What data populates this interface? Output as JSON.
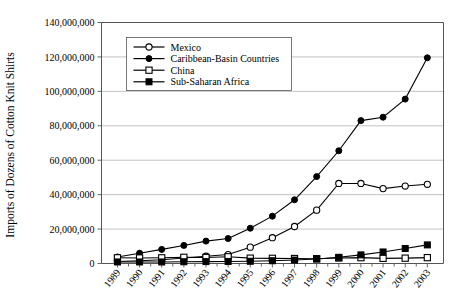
{
  "chart_data": {
    "type": "line",
    "title": "",
    "xlabel": "",
    "ylabel": "Imports of Dozens of Cotton Knit Shirts",
    "categories": [
      "1989",
      "1990",
      "1991",
      "1992",
      "1993",
      "1994",
      "1995",
      "1996",
      "1997",
      "1998",
      "1999",
      "2000",
      "2001",
      "2002",
      "2003"
    ],
    "x": [
      1989,
      1990,
      1991,
      1992,
      1993,
      1994,
      1995,
      1996,
      1997,
      1998,
      1999,
      2000,
      2001,
      2002,
      2003
    ],
    "ylim": [
      0,
      140000000
    ],
    "ytick_values": [
      0,
      20000000,
      40000000,
      60000000,
      80000000,
      100000000,
      120000000,
      140000000
    ],
    "ytick_labels": [
      "0",
      "20,000,000",
      "40,000,000",
      "60,000,000",
      "80,000,000",
      "100,000,000",
      "120,000,000",
      "140,000,000"
    ],
    "grid": "horizontal",
    "legend_position": "upper-left-inside",
    "series": [
      {
        "name": "Mexico",
        "marker": "open-circle",
        "values": [
          1200000,
          1600000,
          2200000,
          3200000,
          4200000,
          5200000,
          9500000,
          15000000,
          21500000,
          31000000,
          46500000,
          46500000,
          43500000,
          45000000,
          46000000
        ]
      },
      {
        "name": "Caribbean-Basin Countries",
        "marker": "filled-circle",
        "values": [
          3800000,
          6000000,
          8200000,
          10500000,
          13000000,
          14500000,
          20500000,
          27500000,
          37000000,
          50500000,
          65500000,
          83000000,
          85000000,
          95500000,
          119500000
        ]
      },
      {
        "name": "China",
        "marker": "open-square",
        "values": [
          3300000,
          3200000,
          3300000,
          3600000,
          3500000,
          3900000,
          3100000,
          3000000,
          2900000,
          2800000,
          3200000,
          3400000,
          3000000,
          3100000,
          3400000
        ]
      },
      {
        "name": "Sub-Saharan Africa",
        "marker": "filled-square",
        "values": [
          900000,
          900000,
          900000,
          1000000,
          1100000,
          1200000,
          1300000,
          1600000,
          2000000,
          2600000,
          3600000,
          5000000,
          6700000,
          8700000,
          10800000
        ]
      }
    ]
  },
  "legend": {
    "items": [
      {
        "label": "Mexico",
        "marker": "open-circle"
      },
      {
        "label": "Caribbean-Basin Countries",
        "marker": "filled-circle"
      },
      {
        "label": "China",
        "marker": "open-square"
      },
      {
        "label": "Sub-Saharan Africa",
        "marker": "filled-square"
      }
    ]
  },
  "colors": {
    "series_stroke": "#000000",
    "gridline": "#a8a8a8",
    "axis": "#555555",
    "background": "#ffffff"
  }
}
